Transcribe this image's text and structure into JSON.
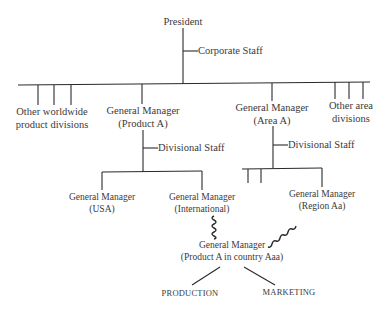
{
  "diagram": {
    "type": "organizational-chart",
    "nodes": {
      "president": "President",
      "corporate_staff": "Corporate Staff",
      "other_worldwide_line1": "Other worldwide",
      "other_worldwide_line2": "product divisions",
      "gm_product_a_line1": "General Manager",
      "gm_product_a_line2": "(Product A)",
      "gm_area_a_line1": "General Manager",
      "gm_area_a_line2": "(Area A)",
      "other_area_line1": "Other area",
      "other_area_line2": "divisions",
      "divisional_staff_product": "Divisional Staff",
      "divisional_staff_area": "Divisional Staff",
      "gm_usa_line1": "General Manager",
      "gm_usa_line2": "(USA)",
      "gm_international_line1": "General Manager",
      "gm_international_line2": "(International)",
      "gm_region_line1": "General Manager",
      "gm_region_line2": "(Region Aa)",
      "gm_country_line1": "General Manager",
      "gm_country_line2": "(Product A in country Aaa)",
      "production": "PRODUCTION",
      "marketing": "MARKETING"
    },
    "edges": [
      {
        "from": "President",
        "to": "Corporate Staff",
        "style": "staff"
      },
      {
        "from": "President",
        "to": "Other worldwide product divisions",
        "style": "solid"
      },
      {
        "from": "President",
        "to": "General Manager (Product A)",
        "style": "solid"
      },
      {
        "from": "President",
        "to": "General Manager (Area A)",
        "style": "solid"
      },
      {
        "from": "President",
        "to": "Other area divisions",
        "style": "solid"
      },
      {
        "from": "General Manager (Product A)",
        "to": "Divisional Staff",
        "style": "staff"
      },
      {
        "from": "General Manager (Product A)",
        "to": "General Manager (USA)",
        "style": "solid"
      },
      {
        "from": "General Manager (Product A)",
        "to": "General Manager (International)",
        "style": "solid"
      },
      {
        "from": "General Manager (Area A)",
        "to": "Divisional Staff",
        "style": "staff"
      },
      {
        "from": "General Manager (Area A)",
        "to": "General Manager (Region Aa)",
        "style": "solid"
      },
      {
        "from": "General Manager (International)",
        "to": "General Manager (Product A in country Aaa)",
        "style": "wavy"
      },
      {
        "from": "General Manager (Region Aa)",
        "to": "General Manager (Product A in country Aaa)",
        "style": "wavy"
      },
      {
        "from": "General Manager (Product A in country Aaa)",
        "to": "PRODUCTION",
        "style": "solid"
      },
      {
        "from": "General Manager (Product A in country Aaa)",
        "to": "MARKETING",
        "style": "solid"
      }
    ],
    "colors": {
      "line": "#2a2a2a",
      "text": "#3a3a3a",
      "background": "#ffffff"
    }
  }
}
